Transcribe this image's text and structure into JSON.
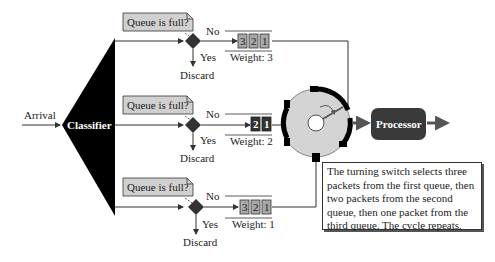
{
  "diagram": {
    "arrival_label": "Arrival",
    "classifier_label": "Classifier",
    "processor_label": "Processor",
    "queues": [
      {
        "question": "Queue is full?",
        "no_label": "No",
        "yes_label": "Yes",
        "discard_label": "Discard",
        "packets": [
          "3",
          "2",
          "1"
        ],
        "weight_label": "Weight: 3"
      },
      {
        "question": "Queue is full?",
        "no_label": "No",
        "yes_label": "Yes",
        "discard_label": "Discard",
        "packets": [
          "2",
          "1"
        ],
        "weight_label": "Weight: 2"
      },
      {
        "question": "Queue is full?",
        "no_label": "No",
        "yes_label": "Yes",
        "discard_label": "Discard",
        "packets": [
          "3",
          "2",
          "1"
        ],
        "weight_label": "Weight: 1"
      }
    ],
    "note": "The turning switch selects three packets from the first queue, then two packets from the second queue, then one packet from the third queue. The cycle repeats.",
    "colors": {
      "classifier": "#000000",
      "processor": "#3a3a3a",
      "switch_fill": "#d4d4d4",
      "callout": "#d0d0d0",
      "packet_light": "#a8a8a8",
      "packet_dark": "#333333"
    }
  }
}
